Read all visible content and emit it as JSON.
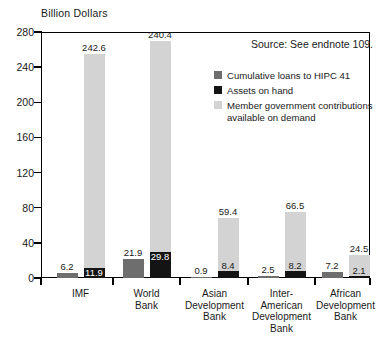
{
  "axis_title": "Billion Dollars",
  "source_note": "Source: See endnote 109.",
  "legend": {
    "items": [
      {
        "label": "Cumulative loans to HIPC 41",
        "color": "#6e6e6e",
        "key": "hipc"
      },
      {
        "label": "Assets on hand",
        "color": "#141414",
        "key": "assets"
      },
      {
        "label": "Member government contributions\navailable on demand",
        "color": "#d3d3d3",
        "key": "member"
      }
    ]
  },
  "chart_data": {
    "type": "bar",
    "title": "",
    "subtitle": "",
    "xlabel": "",
    "ylabel": "Billion Dollars",
    "ylim": [
      0,
      280
    ],
    "yticks": [
      0,
      40,
      80,
      120,
      160,
      200,
      240,
      280
    ],
    "ytick_labels": [
      "0",
      "40",
      "80",
      "120",
      "160",
      "200",
      "240",
      "280"
    ],
    "grid": false,
    "legend_position": "upper-right-inside",
    "stacked": true,
    "categories": [
      "IMF",
      "World\nBank",
      "Asian\nDevelopment\nBank",
      "Inter-\nAmerican\nDevelopment\nBank",
      "African\nDevelopment\nBank"
    ],
    "series": [
      {
        "name": "Cumulative loans to HIPC 41",
        "color": "#6e6e6e",
        "values": [
          6.2,
          21.9,
          0.9,
          2.5,
          7.2
        ]
      },
      {
        "name": "Assets on hand",
        "color": "#141414",
        "values": [
          11.9,
          29.8,
          8.4,
          8.2,
          2.1
        ]
      },
      {
        "name": "Member government contributions available on demand",
        "color": "#d3d3d3",
        "values": [
          242.6,
          240.4,
          59.4,
          66.5,
          24.5
        ]
      }
    ],
    "data_labels": {
      "hipc": [
        "6.2",
        "21.9",
        "0.9",
        "2.5",
        "7.2"
      ],
      "assets": [
        "11.9",
        "29.8",
        "8.4",
        "8.2",
        "2.1"
      ],
      "member": [
        "242.6",
        "240.4",
        "59.4",
        "66.5",
        "24.5"
      ]
    }
  }
}
